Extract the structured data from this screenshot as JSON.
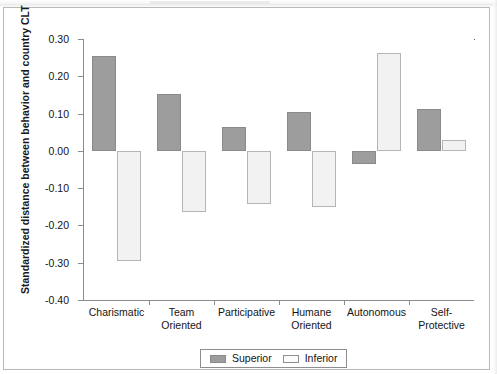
{
  "chart_data": {
    "type": "bar",
    "title": "",
    "xlabel": "",
    "ylabel": "Standardized distance between behavior and country CLT",
    "ylim": [
      -0.4,
      0.3
    ],
    "ytick_labels": [
      "0.30",
      "0.20",
      "0.10",
      "0.00",
      "-0.10",
      "-0.20",
      "-0.30",
      "-0.40"
    ],
    "ytick_values": [
      0.3,
      0.2,
      0.1,
      0.0,
      -0.1,
      -0.2,
      -0.3,
      -0.4
    ],
    "grid": false,
    "legend_position": "bottom-center",
    "categories": [
      "Charismatic",
      "Team Oriented",
      "Participative",
      "Humane Oriented",
      "Autonomous",
      "Self-Protective"
    ],
    "category_lines": [
      [
        "Charismatic",
        ""
      ],
      [
        "Team",
        "Oriented"
      ],
      [
        "Participative",
        ""
      ],
      [
        "Humane",
        "Oriented"
      ],
      [
        "Autonomous",
        ""
      ],
      [
        "Self-",
        "Protective"
      ]
    ],
    "series": [
      {
        "name": "Superior",
        "color": "#9d9d9d",
        "values": [
          0.255,
          0.152,
          0.065,
          0.105,
          -0.035,
          0.112
        ]
      },
      {
        "name": "Inferior",
        "color": "#f2f2f2",
        "values": [
          -0.295,
          -0.165,
          -0.143,
          -0.15,
          0.262,
          0.03
        ]
      }
    ]
  },
  "legend": {
    "items": [
      {
        "label": "Superior",
        "swatch": "superior"
      },
      {
        "label": "Inferior",
        "swatch": "inferior"
      }
    ]
  }
}
